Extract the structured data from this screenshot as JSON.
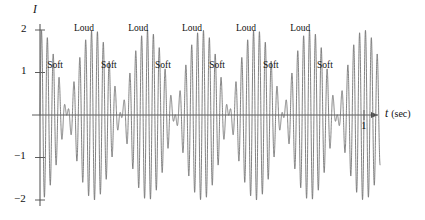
{
  "chart_data": {
    "type": "line",
    "title": "",
    "xlabel": "t (sec)",
    "ylabel": "I",
    "xlim": [
      0,
      1.05
    ],
    "ylim": [
      -2.2,
      2.2
    ],
    "grid": false,
    "legend": null,
    "x_ticks": [
      {
        "value": 1,
        "label": "1"
      }
    ],
    "y_ticks": [
      {
        "value": 2,
        "label": "2"
      },
      {
        "value": 1,
        "label": "1"
      },
      {
        "value": -1,
        "label": "−1"
      },
      {
        "value": -2,
        "label": "−2"
      }
    ],
    "series": [
      {
        "name": "I(t)",
        "description": "Beats: superposition of two close-frequency tones, envelope 2*cos(pi*f_beat*t)",
        "color": "#6b6b6b",
        "carrier_frequency_hz": 55,
        "beat_frequency_hz": 6,
        "amplitude": 2
      }
    ],
    "annotations": [
      {
        "text": "Loud",
        "x": 0.105,
        "y": 2.15
      },
      {
        "text": "Loud",
        "x": 0.272,
        "y": 2.15
      },
      {
        "text": "Loud",
        "x": 0.438,
        "y": 2.15
      },
      {
        "text": "Loud",
        "x": 0.605,
        "y": 2.15
      },
      {
        "text": "Loud",
        "x": 0.772,
        "y": 2.15
      },
      {
        "text": "Soft",
        "x": 0.022,
        "y": 1.28
      },
      {
        "text": "Soft",
        "x": 0.188,
        "y": 1.28
      },
      {
        "text": "Soft",
        "x": 0.355,
        "y": 1.28
      },
      {
        "text": "Soft",
        "x": 0.522,
        "y": 1.28
      },
      {
        "text": "Soft",
        "x": 0.688,
        "y": 1.28
      },
      {
        "text": "Soft",
        "x": 0.855,
        "y": 1.28
      }
    ]
  },
  "axis": {
    "y_name": "I",
    "x_name": "t",
    "x_unit": "(sec)"
  }
}
